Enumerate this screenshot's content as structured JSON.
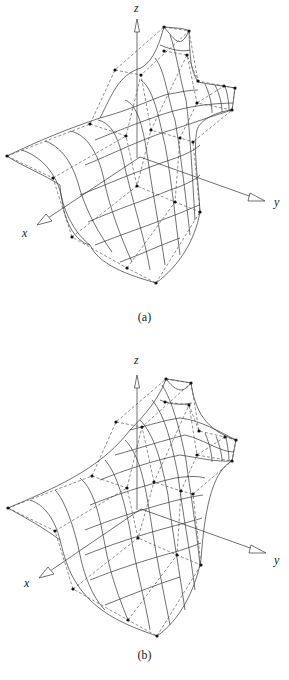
{
  "figures": [
    {
      "id": "a",
      "caption": "(a)",
      "axes": {
        "x": "x",
        "y": "y",
        "z": "z"
      },
      "description": "Bicubic surface patch network with control polygon (dashed) and control points (dots)"
    },
    {
      "id": "b",
      "caption": "(b)",
      "axes": {
        "x": "x",
        "y": "y",
        "z": "z"
      },
      "description": "Modified surface patch network with control polygon (dashed) and control points (dots)"
    }
  ],
  "colors": {
    "line": "#333333",
    "dash": "#444444",
    "point": "#111111",
    "background": "#ffffff"
  }
}
